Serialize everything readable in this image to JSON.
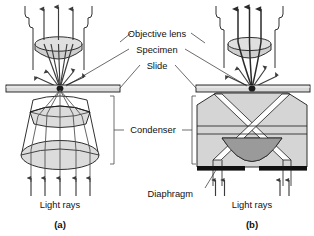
{
  "figure": {
    "labels": {
      "objective_lens": "Objective lens",
      "specimen": "Specimen",
      "slide": "Slide",
      "condenser": "Condenser",
      "diaphragm": "Diaphragm",
      "light_rays_a": "Light rays",
      "light_rays_b": "Light rays"
    },
    "panels": [
      {
        "id": "a",
        "caption": "(a)",
        "type": "brightfield"
      },
      {
        "id": "b",
        "caption": "(b)",
        "type": "darkfield"
      }
    ],
    "colors": {
      "background": "#ffffff",
      "outline": "#1a1a1a",
      "lens_fill": "#dcdcdc",
      "lens_fill_dark": "#cfcfcf",
      "glass_body": "#d5d5d5",
      "dark_dome": "#9a9a9a",
      "slide_fill": "#d9d9d9",
      "diaphragm_black": "#101010",
      "ray_stroke": "#3c3c3c",
      "text": "#111111"
    }
  }
}
